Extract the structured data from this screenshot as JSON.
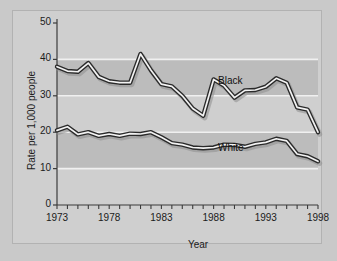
{
  "figure": {
    "background_color": "#c9c9c9",
    "panel_color": "#cfcfcf",
    "band_color": "#bcbcbc",
    "line_dark_color": "#2a2a2a",
    "line_light_color": "#f2f2f2"
  },
  "axis": {
    "y_label": "Rate per 1,000 people",
    "x_label": "Year",
    "y_ticks": [
      "0",
      "10",
      "20",
      "30",
      "40",
      "50"
    ],
    "x_ticks": [
      "1973",
      "1978",
      "1983",
      "1988",
      "1993",
      "1998"
    ]
  },
  "labels": {
    "black": "Black",
    "white": "White"
  },
  "chart_data": {
    "type": "line",
    "title": "",
    "xlabel": "Year",
    "ylabel": "Rate per 1,000 people",
    "xlim": [
      1973,
      1998
    ],
    "ylim": [
      0,
      50
    ],
    "ytick_values": [
      0,
      10,
      20,
      30,
      40,
      50
    ],
    "xtick_values": [
      1973,
      1978,
      1983,
      1988,
      1993,
      1998
    ],
    "grid": false,
    "banded_background": true,
    "legend": "inline-annotations",
    "x": [
      1973,
      1974,
      1975,
      1976,
      1977,
      1978,
      1979,
      1980,
      1981,
      1982,
      1983,
      1984,
      1985,
      1986,
      1987,
      1988,
      1989,
      1990,
      1991,
      1992,
      1993,
      1994,
      1995,
      1996,
      1997,
      1998
    ],
    "series": [
      {
        "name": "Black",
        "values": [
          38.0,
          36.8,
          36.6,
          39.0,
          35.2,
          34.0,
          33.6,
          33.6,
          41.5,
          37.0,
          33.2,
          32.6,
          30.0,
          26.5,
          24.5,
          34.5,
          32.8,
          29.5,
          31.5,
          31.6,
          32.5,
          34.8,
          33.6,
          26.8,
          26.2,
          20.0
        ]
      },
      {
        "name": "White",
        "values": [
          20.5,
          21.5,
          19.4,
          20.0,
          19.0,
          19.5,
          19.0,
          19.6,
          19.5,
          20.0,
          18.6,
          17.0,
          16.6,
          15.8,
          15.6,
          15.8,
          16.6,
          16.5,
          16.0,
          16.8,
          17.2,
          18.2,
          17.6,
          14.0,
          13.4,
          12.0
        ]
      }
    ]
  }
}
